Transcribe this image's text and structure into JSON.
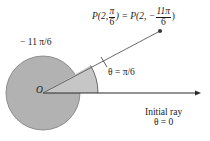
{
  "figure": {
    "background_color": "#ffffff",
    "circle_fill": "#b2b2b2",
    "sector_fill": "#c6c6c6",
    "stroke_color": "#3a3a3a",
    "text_color": "#1a1a1a"
  },
  "labels": {
    "point_label": {
      "prefix": "P(2,",
      "frac1_num": "π",
      "frac1_den": "6",
      "middle": ") = P(2, −",
      "frac2_num": "11π",
      "frac2_den": "6",
      "suffix": ")"
    },
    "negative_angle": "− 11 π/6",
    "theta_angle": "θ = π/6",
    "initial_ray_line1": "Initial ray",
    "initial_ray_line2": "θ = 0",
    "origin": "O"
  },
  "geometry": {
    "origin_x": 43,
    "origin_y": 93,
    "circle_radius": 37,
    "sector_radius": 55,
    "terminal_angle_deg": 30,
    "point_p_x": 160,
    "point_p_y": 31,
    "initial_ray_end_x": 201
  }
}
